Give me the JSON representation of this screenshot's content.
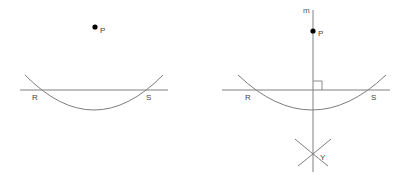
{
  "figure": {
    "background_color": "#ffffff",
    "stroke_color": "#808080",
    "point_color": "#000000",
    "label_color": "#444444",
    "width": 411,
    "height": 187
  },
  "panels": [
    {
      "id": "left-panel",
      "name": "step-one-arc-construction",
      "points": [
        {
          "id": "P",
          "label": "P",
          "x": 95,
          "y": 27,
          "dot": true
        },
        {
          "id": "R",
          "label": "R",
          "x": 37,
          "y": 90,
          "dot": false
        },
        {
          "id": "S",
          "label": "S",
          "x": 148,
          "y": 90,
          "dot": false
        }
      ],
      "labels": {
        "point_p": "P",
        "point_r": "R",
        "point_s": "S"
      }
    },
    {
      "id": "right-panel",
      "name": "step-two-perpendicular-construction",
      "points": [
        {
          "id": "P",
          "label": "P",
          "x": 313,
          "y": 31,
          "dot": true
        },
        {
          "id": "R",
          "label": "R",
          "x": 250,
          "y": 90,
          "dot": false
        },
        {
          "id": "S",
          "label": "S",
          "x": 373,
          "y": 90,
          "dot": false
        },
        {
          "id": "Y",
          "label": "Y",
          "x": 313,
          "y": 155,
          "dot": false
        }
      ],
      "labels": {
        "line_m": "m",
        "point_p": "P",
        "point_r": "R",
        "point_s": "S",
        "point_y": "Y"
      }
    }
  ]
}
